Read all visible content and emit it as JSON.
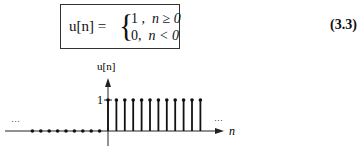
{
  "equation": {
    "lhs": "u[n] =",
    "brace": "{",
    "cases": [
      {
        "value": "1 ,",
        "condition": "n ≥ 0"
      },
      {
        "value": "0,",
        "condition": "n < 0"
      }
    ],
    "number": "(3.3)"
  },
  "chart_data": {
    "type": "stem",
    "title": "",
    "ylabel": "u[n]",
    "xlabel": "n",
    "ytick_labels": [
      "1"
    ],
    "annotations": [
      "...",
      "..."
    ],
    "x": [
      -9,
      -8,
      -7,
      -6,
      -5,
      -4,
      -3,
      -2,
      -1,
      0,
      1,
      2,
      3,
      4,
      5,
      6,
      7,
      8,
      9,
      10,
      11
    ],
    "values": [
      0,
      0,
      0,
      0,
      0,
      0,
      0,
      0,
      0,
      1,
      1,
      1,
      1,
      1,
      1,
      1,
      1,
      1,
      1,
      1,
      1
    ],
    "ylim": [
      0,
      1.3
    ],
    "grid": false
  },
  "figure": {
    "ylabel": "u[n]",
    "xlabel": "n",
    "ytick": "1",
    "ellipsis_left": "···",
    "ellipsis_right": "···"
  }
}
